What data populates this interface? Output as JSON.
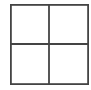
{
  "icon": {
    "name": "grid-2x2-icon",
    "rows": 2,
    "cols": 2,
    "stroke_color": "#444444",
    "background": "#ffffff"
  }
}
